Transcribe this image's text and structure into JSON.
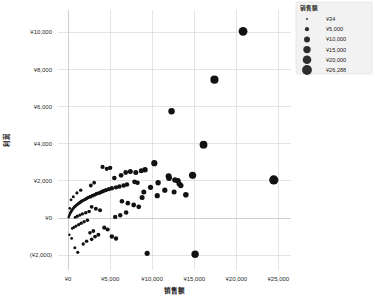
{
  "chart_data": {
    "type": "scatter",
    "title": "",
    "xlabel": "销售额",
    "ylabel": "利润",
    "xlim": [
      -1200,
      26500
    ],
    "ylim": [
      -2800,
      11200
    ],
    "grid": true,
    "x_ticks": [
      0,
      5000,
      10000,
      15000,
      20000,
      25000
    ],
    "x_tick_labels": [
      "¥0",
      "¥5,000",
      "¥10,000",
      "¥15,000",
      "¥20,000",
      "¥25,000"
    ],
    "y_ticks": [
      -2000,
      0,
      2000,
      4000,
      6000,
      8000,
      10000
    ],
    "y_tick_labels": [
      "(¥2,000)",
      "¥0",
      "¥2,000",
      "¥4,000",
      "¥6,000",
      "¥8,000",
      "¥10,000"
    ],
    "size_legend": {
      "title": "销售额",
      "position": "top-right",
      "entries": [
        {
          "label": "¥34",
          "value": 34,
          "radius": 0.9
        },
        {
          "label": "¥5,000",
          "value": 5000,
          "radius": 2.1
        },
        {
          "label": "¥10,000",
          "value": 10000,
          "radius": 3.0
        },
        {
          "label": "¥15,000",
          "value": 15000,
          "radius": 3.7
        },
        {
          "label": "¥20,000",
          "value": 20000,
          "radius": 4.3
        },
        {
          "label": "¥26,288",
          "value": 26288,
          "radius": 4.9
        }
      ]
    },
    "marker_color": "#121212",
    "points": [
      {
        "x": 20800,
        "y": 10050,
        "r": 4.4
      },
      {
        "x": 17400,
        "y": 7450,
        "r": 4.1
      },
      {
        "x": 12300,
        "y": 5750,
        "r": 3.2
      },
      {
        "x": 16100,
        "y": 3950,
        "r": 3.9
      },
      {
        "x": 24450,
        "y": 2050,
        "r": 4.6
      },
      {
        "x": 14800,
        "y": 2300,
        "r": 3.6
      },
      {
        "x": 10250,
        "y": 2950,
        "r": 3.1
      },
      {
        "x": 11950,
        "y": 2250,
        "r": 3.0
      },
      {
        "x": 12000,
        "y": 2150,
        "r": 2.9
      },
      {
        "x": 12700,
        "y": 2050,
        "r": 2.7
      },
      {
        "x": 13050,
        "y": 2000,
        "r": 2.8
      },
      {
        "x": 13200,
        "y": 1850,
        "r": 2.6
      },
      {
        "x": 13400,
        "y": 1750,
        "r": 2.7
      },
      {
        "x": 11500,
        "y": 1500,
        "r": 2.6
      },
      {
        "x": 12600,
        "y": 1400,
        "r": 2.5
      },
      {
        "x": 14000,
        "y": 1250,
        "r": 2.8
      },
      {
        "x": 10600,
        "y": 1200,
        "r": 2.6
      },
      {
        "x": 9150,
        "y": 2600,
        "r": 2.7
      },
      {
        "x": 8700,
        "y": 2550,
        "r": 2.5
      },
      {
        "x": 8050,
        "y": 2450,
        "r": 2.5
      },
      {
        "x": 7400,
        "y": 2500,
        "r": 2.5
      },
      {
        "x": 6850,
        "y": 2450,
        "r": 2.4
      },
      {
        "x": 6300,
        "y": 2300,
        "r": 2.4
      },
      {
        "x": 5500,
        "y": 2150,
        "r": 2.3
      },
      {
        "x": 7900,
        "y": 1950,
        "r": 2.4
      },
      {
        "x": 8250,
        "y": 1900,
        "r": 2.3
      },
      {
        "x": 7000,
        "y": 1800,
        "r": 2.3
      },
      {
        "x": 6600,
        "y": 1750,
        "r": 2.3
      },
      {
        "x": 6100,
        "y": 1700,
        "r": 2.2
      },
      {
        "x": 5700,
        "y": 1650,
        "r": 2.2
      },
      {
        "x": 5200,
        "y": 1600,
        "r": 2.2
      },
      {
        "x": 4850,
        "y": 1550,
        "r": 2.1
      },
      {
        "x": 4500,
        "y": 1500,
        "r": 2.1
      },
      {
        "x": 4200,
        "y": 1450,
        "r": 2.1
      },
      {
        "x": 3950,
        "y": 1400,
        "r": 2.0
      },
      {
        "x": 3700,
        "y": 1350,
        "r": 2.0
      },
      {
        "x": 3400,
        "y": 1300,
        "r": 2.0
      },
      {
        "x": 3150,
        "y": 1250,
        "r": 1.9
      },
      {
        "x": 2900,
        "y": 1200,
        "r": 1.9
      },
      {
        "x": 2650,
        "y": 1150,
        "r": 1.9
      },
      {
        "x": 2400,
        "y": 1100,
        "r": 1.8
      },
      {
        "x": 2200,
        "y": 1050,
        "r": 1.8
      },
      {
        "x": 2000,
        "y": 1000,
        "r": 1.8
      },
      {
        "x": 1800,
        "y": 950,
        "r": 1.7
      },
      {
        "x": 1600,
        "y": 900,
        "r": 1.7
      },
      {
        "x": 1450,
        "y": 850,
        "r": 1.7
      },
      {
        "x": 1300,
        "y": 800,
        "r": 1.6
      },
      {
        "x": 1150,
        "y": 750,
        "r": 1.6
      },
      {
        "x": 1000,
        "y": 700,
        "r": 1.6
      },
      {
        "x": 880,
        "y": 650,
        "r": 1.5
      },
      {
        "x": 760,
        "y": 600,
        "r": 1.5
      },
      {
        "x": 650,
        "y": 540,
        "r": 1.5
      },
      {
        "x": 550,
        "y": 480,
        "r": 1.4
      },
      {
        "x": 460,
        "y": 420,
        "r": 1.4
      },
      {
        "x": 380,
        "y": 360,
        "r": 1.4
      },
      {
        "x": 300,
        "y": 300,
        "r": 1.3
      },
      {
        "x": 240,
        "y": 240,
        "r": 1.3
      },
      {
        "x": 180,
        "y": 180,
        "r": 1.2
      },
      {
        "x": 130,
        "y": 120,
        "r": 1.2
      },
      {
        "x": 90,
        "y": 70,
        "r": 1.1
      },
      {
        "x": 60,
        "y": 30,
        "r": 1.1
      },
      {
        "x": 2800,
        "y": 600,
        "r": 1.9
      },
      {
        "x": 3300,
        "y": 500,
        "r": 2.0
      },
      {
        "x": 3800,
        "y": 420,
        "r": 2.0
      },
      {
        "x": 2500,
        "y": 350,
        "r": 1.8
      },
      {
        "x": 2100,
        "y": 280,
        "r": 1.8
      },
      {
        "x": 1700,
        "y": 220,
        "r": 1.7
      },
      {
        "x": 1400,
        "y": 160,
        "r": 1.6
      },
      {
        "x": 1100,
        "y": 100,
        "r": 1.6
      },
      {
        "x": 850,
        "y": 40,
        "r": 1.5
      },
      {
        "x": 2300,
        "y": -120,
        "r": 1.8
      },
      {
        "x": 1900,
        "y": -200,
        "r": 1.7
      },
      {
        "x": 1550,
        "y": -280,
        "r": 1.7
      },
      {
        "x": 1250,
        "y": -360,
        "r": 1.6
      },
      {
        "x": 950,
        "y": -430,
        "r": 1.5
      },
      {
        "x": 700,
        "y": -500,
        "r": 1.5
      },
      {
        "x": 500,
        "y": -560,
        "r": 1.4
      },
      {
        "x": 3000,
        "y": -700,
        "r": 1.9
      },
      {
        "x": 2600,
        "y": -800,
        "r": 1.8
      },
      {
        "x": 4300,
        "y": -520,
        "r": 2.1
      },
      {
        "x": 4700,
        "y": -620,
        "r": 2.1
      },
      {
        "x": 3600,
        "y": -900,
        "r": 2.0
      },
      {
        "x": 3200,
        "y": -1000,
        "r": 1.9
      },
      {
        "x": 2800,
        "y": -1150,
        "r": 1.8
      },
      {
        "x": 2200,
        "y": -1250,
        "r": 1.8
      },
      {
        "x": 1800,
        "y": -1400,
        "r": 1.7
      },
      {
        "x": 5200,
        "y": -1000,
        "r": 2.2
      },
      {
        "x": 5700,
        "y": -1100,
        "r": 2.2
      },
      {
        "x": 9400,
        "y": -1900,
        "r": 2.6
      },
      {
        "x": 15100,
        "y": -1950,
        "r": 3.7
      },
      {
        "x": 6400,
        "y": 900,
        "r": 2.3
      },
      {
        "x": 7100,
        "y": 800,
        "r": 2.3
      },
      {
        "x": 7800,
        "y": 700,
        "r": 2.4
      },
      {
        "x": 8400,
        "y": 600,
        "r": 2.4
      },
      {
        "x": 6900,
        "y": 300,
        "r": 2.3
      },
      {
        "x": 6200,
        "y": 150,
        "r": 2.2
      },
      {
        "x": 5600,
        "y": 60,
        "r": 2.2
      },
      {
        "x": 9800,
        "y": 1650,
        "r": 2.6
      },
      {
        "x": 10700,
        "y": 1900,
        "r": 2.7
      },
      {
        "x": 4100,
        "y": 2750,
        "r": 2.1
      },
      {
        "x": 4600,
        "y": 2650,
        "r": 2.1
      },
      {
        "x": 5000,
        "y": 2700,
        "r": 2.2
      },
      {
        "x": 9000,
        "y": 1400,
        "r": 2.5
      },
      {
        "x": 8800,
        "y": 1100,
        "r": 2.5
      },
      {
        "x": 150,
        "y": -900,
        "r": 1.2
      },
      {
        "x": 420,
        "y": -1100,
        "r": 1.4
      },
      {
        "x": 800,
        "y": -1600,
        "r": 1.5
      },
      {
        "x": 1150,
        "y": -1850,
        "r": 1.6
      },
      {
        "x": 350,
        "y": 980,
        "r": 1.4
      },
      {
        "x": 620,
        "y": 1150,
        "r": 1.5
      },
      {
        "x": 1050,
        "y": 1350,
        "r": 1.6
      },
      {
        "x": 1500,
        "y": 1500,
        "r": 1.7
      },
      {
        "x": 200,
        "y": 520,
        "r": 1.3
      },
      {
        "x": 2700,
        "y": 1750,
        "r": 1.9
      },
      {
        "x": 3100,
        "y": 1900,
        "r": 1.9
      }
    ]
  }
}
